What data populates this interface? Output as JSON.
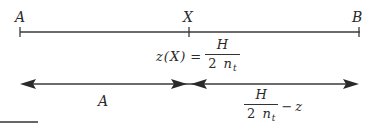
{
  "diagram": {
    "points": {
      "left_label": "A",
      "mid_label": "X",
      "right_label": "B"
    },
    "formula_top": {
      "lhs": "z(X)",
      "equals": "=",
      "numerator": "H",
      "denominator_coef": "2",
      "denominator_var": "n",
      "denominator_sub": "t"
    },
    "segment_left": {
      "label": "A"
    },
    "segment_right": {
      "numerator": "H",
      "denominator_coef": "2",
      "denominator_var": "n",
      "denominator_sub": "t",
      "minus": "−",
      "subtrahend": "z"
    },
    "colors": {
      "line": "#3a3a3a",
      "arrow": "#2a2a2a",
      "background": "#ffffff"
    }
  }
}
